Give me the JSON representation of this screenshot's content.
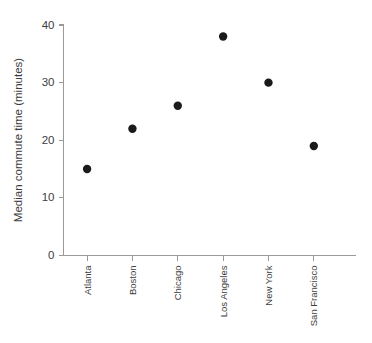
{
  "chart_data": {
    "type": "scatter",
    "title": "",
    "xlabel": "",
    "ylabel": "Median commute time (minutes)",
    "categories": [
      "Atlanta",
      "Boston",
      "Chicago",
      "Los Angeles",
      "New York",
      "San Francisco"
    ],
    "values": [
      15,
      22,
      26,
      38,
      30,
      19
    ],
    "series": [
      {
        "name": "Median commute time",
        "values": [
          15,
          22,
          26,
          38,
          30,
          19
        ]
      }
    ],
    "points": [
      {
        "category": "Atlanta",
        "value": 15
      },
      {
        "category": "Boston",
        "value": 22
      },
      {
        "category": "Chicago",
        "value": 26
      },
      {
        "category": "Los Angeles",
        "value": 38
      },
      {
        "category": "New York",
        "value": 30
      },
      {
        "category": "San Francisco",
        "value": 19
      }
    ],
    "ylim": [
      0,
      40
    ],
    "yticks": [
      0,
      10,
      20,
      30,
      40
    ],
    "ytick_labels": [
      "0",
      "10",
      "20",
      "30",
      "40"
    ],
    "grid": false,
    "legend": false,
    "legend_position": "none",
    "marker": "circle",
    "marker_color": "#1a1a1a",
    "axis_color": "#9a9a9a",
    "background_color": "#ffffff",
    "xtick_label_rotation": 90
  }
}
